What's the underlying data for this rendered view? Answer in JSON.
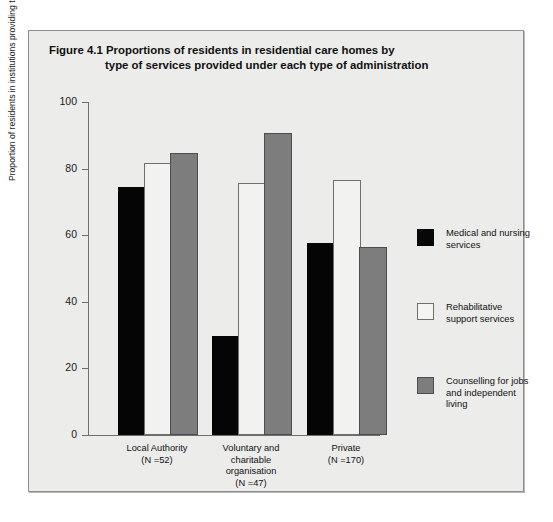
{
  "figure": {
    "title_line1": "Figure 4.1  Proportions of residents in residential care homes by",
    "title_line2": "type of services provided under each type of administration"
  },
  "chart_data": {
    "type": "bar",
    "title": "Figure 4.1  Proportions of residents in residential care homes by type of services provided under each type of administration",
    "xlabel": "",
    "ylabel": "Proportion of residents in institutions providing the service",
    "ylim": [
      0,
      100
    ],
    "yticks": [
      0,
      20,
      40,
      60,
      80,
      100
    ],
    "ytick_labels": [
      "0",
      "20",
      "40",
      "60",
      "80",
      "100"
    ],
    "grid": false,
    "legend_position": "right",
    "categories": [
      "Local Authority\n(N =52)",
      "Voluntary and charitable organisation\n(N =47)",
      "Private\n(N =170)"
    ],
    "category_lines": [
      [
        "Local Authority",
        "(N =52)"
      ],
      [
        "Voluntary and",
        "charitable",
        "organisation",
        "(N =47)"
      ],
      [
        "Private",
        "(N =170)"
      ]
    ],
    "series": [
      {
        "name": "Medical and nursing services",
        "color": "#070707",
        "values": [
          74,
          29,
          57
        ]
      },
      {
        "name": "Rehabilitative support services",
        "color": "#f4f4f3",
        "values": [
          81,
          75,
          76
        ]
      },
      {
        "name": "Counselling for jobs and independent living",
        "color": "#7d7d7d",
        "values": [
          84,
          90,
          56
        ]
      }
    ]
  },
  "legend": {
    "items": [
      {
        "swatch": "black",
        "line1": "Medical and nursing",
        "line2": "services",
        "line3": ""
      },
      {
        "swatch": "white",
        "line1": "Rehabilitative",
        "line2": "support services",
        "line3": ""
      },
      {
        "swatch": "grey",
        "line1": "Counselling for jobs",
        "line2": "and independent",
        "line3": "living"
      }
    ]
  }
}
